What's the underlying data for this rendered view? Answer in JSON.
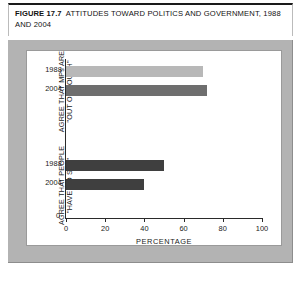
{
  "figure": {
    "number": "FIGURE 17.7",
    "title": "ATTITUDES TOWARD POLITICS AND GOVERNMENT, 1988 AND 2004"
  },
  "chart_data": {
    "type": "bar",
    "orientation": "horizontal",
    "title": "ATTITUDES TOWARD POLITICS AND GOVERNMENT, 1988 AND 2004",
    "xlabel": "PERCENTAGE",
    "ylabel": "",
    "xlim": [
      0,
      100
    ],
    "xticks": [
      0,
      20,
      40,
      60,
      80,
      100
    ],
    "xtick_labels": [
      "0",
      "20",
      "40",
      "60",
      "80",
      "100"
    ],
    "y_origin_label": "0",
    "grid": false,
    "legend": "none",
    "groups": [
      {
        "label": "AGREE THAT MPs ARE\n\"OUT OF TOUCH\"",
        "bars": [
          {
            "category": "1988",
            "value": 70,
            "color": "#b8b8b8"
          },
          {
            "category": "2004",
            "value": 72,
            "color": "#6e6e6e"
          }
        ]
      },
      {
        "label": "AGREE THAT PEOPLE\n\"HAVE NO SAY\"",
        "bars": [
          {
            "category": "1988",
            "value": 50,
            "color": "#3f3f3f"
          },
          {
            "category": "2004",
            "value": 40,
            "color": "#3f3f3f"
          }
        ]
      }
    ]
  },
  "colors": {
    "panel_background": "#b3b3b3",
    "card_background": "#ffffff",
    "axis": "#2a2a2a",
    "text": "#1a1a1a"
  }
}
